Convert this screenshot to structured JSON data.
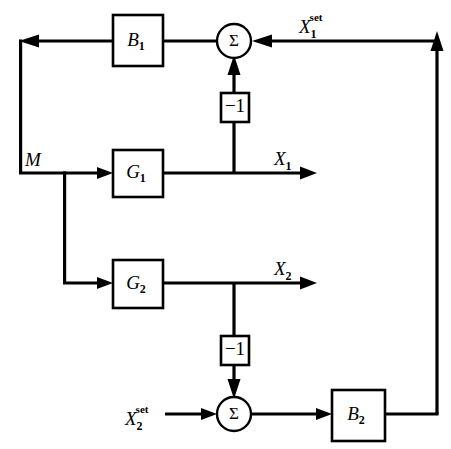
{
  "diagram": {
    "type": "control-block-diagram",
    "background_color": "#ffffff",
    "line_color": "#000000",
    "blocks": [
      {
        "id": "B1",
        "label": "B",
        "subscript": "1",
        "x": 113,
        "y": 15,
        "w": 50,
        "h": 51
      },
      {
        "id": "G1",
        "label": "G",
        "subscript": "1",
        "x": 113,
        "y": 150,
        "w": 50,
        "h": 47
      },
      {
        "id": "G2",
        "label": "G",
        "subscript": "2",
        "x": 113,
        "y": 260,
        "w": 50,
        "h": 48
      },
      {
        "id": "B2",
        "label": "B",
        "subscript": "2",
        "x": 332,
        "y": 390,
        "w": 53,
        "h": 51
      },
      {
        "id": "gain_top",
        "label": "−1",
        "x": 221,
        "y": 93,
        "w": 28,
        "h": 29
      },
      {
        "id": "gain_bottom",
        "label": "−1",
        "x": 221,
        "y": 336,
        "w": 28,
        "h": 29
      }
    ],
    "summing_junctions": [
      {
        "id": "sum_top",
        "label": "Σ",
        "cx": 234,
        "cy": 41,
        "r": 17
      },
      {
        "id": "sum_bottom",
        "label": "Σ",
        "cx": 234,
        "cy": 414,
        "r": 17
      }
    ],
    "signals": [
      {
        "id": "M",
        "base": "M",
        "sub": "",
        "sup": "",
        "x": 25,
        "y": 164
      },
      {
        "id": "X1",
        "base": "X",
        "sub": "1",
        "sup": "",
        "x": 274,
        "y": 162
      },
      {
        "id": "X2",
        "base": "X",
        "sub": "2",
        "sup": "",
        "x": 274,
        "y": 272
      },
      {
        "id": "X1set",
        "base": "X",
        "sub": "1",
        "sup": "set",
        "x": 299,
        "y": 30
      },
      {
        "id": "X2set",
        "base": "X",
        "sub": "2",
        "sup": "set",
        "x": 125,
        "y": 422
      }
    ],
    "labels": {
      "B1": "B₁",
      "B2": "B₂",
      "G1": "G₁",
      "G2": "G₂",
      "gain_top": "−1",
      "gain_bottom": "−1",
      "sum_top": "Σ",
      "sum_bottom": "Σ",
      "M": "M",
      "X1": "X₁",
      "X2": "X₂",
      "X1set": "X₁ˢᵉᵗ",
      "X2set": "X₂ˢᵉᵗ",
      "minus_one": "−1",
      "sigma": "Σ",
      "set_superscript": "set",
      "sub_1": "1",
      "sub_2": "2",
      "letter_B": "B",
      "letter_G": "G",
      "letter_X": "X",
      "letter_M": "M"
    }
  }
}
